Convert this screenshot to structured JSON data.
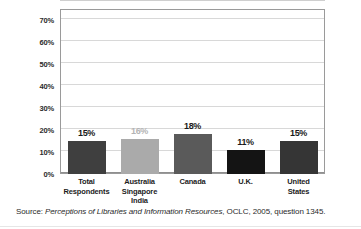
{
  "chart_data": {
    "type": "bar",
    "title": "",
    "subtitle": "",
    "xlabel": "",
    "ylabel": "",
    "categories": [
      "Total Respondents",
      "Australia Singapore India",
      "Canada",
      "U.K.",
      "United States"
    ],
    "category_lines": [
      [
        "Total",
        "Respondents"
      ],
      [
        "Australia",
        "Singapore",
        "India"
      ],
      [
        "Canada"
      ],
      [
        "U.K."
      ],
      [
        "United",
        "States"
      ]
    ],
    "values": [
      15,
      16,
      18,
      11,
      15
    ],
    "value_labels": [
      "15%",
      "16%",
      "18%",
      "11%",
      "15%"
    ],
    "bar_colors": [
      "#3f3f3f",
      "#aaaaaa",
      "#5a5a5a",
      "#141414",
      "#353535"
    ],
    "value_label_colors": [
      "#1a1a1a",
      "#b4b4b4",
      "#1a1a1a",
      "#1a1a1a",
      "#1a1a1a"
    ],
    "ylim": [
      0,
      75
    ],
    "yticks": [
      0,
      10,
      20,
      30,
      40,
      50,
      60,
      70
    ],
    "ytick_labels": [
      "0%",
      "10%",
      "20%",
      "30%",
      "40%",
      "50%",
      "60%",
      "70%"
    ],
    "grid": true,
    "grid_color": "#d8d8d8",
    "legend": "none",
    "frame_color": "#9a9a9a"
  },
  "caption": {
    "prefix": "Source: ",
    "italic_title": "Perceptions of Libraries and Information Resources",
    "suffix": ", OCLC, 2005, question 1345."
  }
}
